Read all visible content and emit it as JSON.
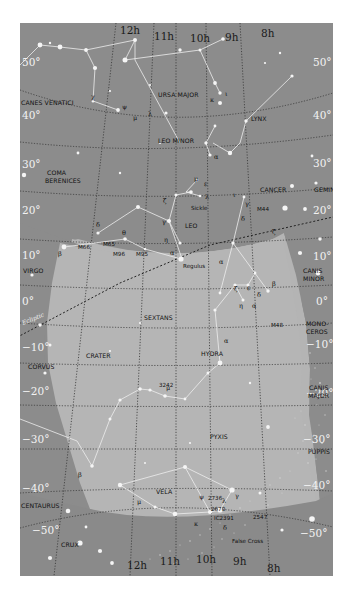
{
  "map": {
    "colors": {
      "outside_region": "#8c8c8c",
      "highlight_region": "#b4b4b4",
      "grid": "#3a3a3a",
      "constellation_lines": "#eeeeee",
      "stars": "#f4f4f4",
      "labels": "#111111"
    },
    "ra_labels_top": [
      "12h",
      "11h",
      "10h",
      "9h",
      "8h"
    ],
    "ra_labels_bottom": [
      "12h",
      "11h",
      "10h",
      "9h",
      "8h"
    ],
    "dec_labels_left": [
      "50°",
      "40°",
      "30°",
      "20°",
      "10°",
      "0°",
      "−10°",
      "−20°",
      "−30°",
      "−40°",
      "−50°"
    ],
    "dec_labels_right": [
      "50°",
      "40°",
      "30°",
      "20°",
      "10°",
      "0°",
      "−10°",
      "−20°",
      "−30°",
      "−40°",
      "−50°"
    ],
    "ecliptic_label": "Ecliptic",
    "constellations": [
      {
        "name": "URSA MAJOR"
      },
      {
        "name": "CANES VENATICI"
      },
      {
        "name": "LYNX"
      },
      {
        "name": "LEO MINOR"
      },
      {
        "name": "COMA BERENICES",
        "line1": "COMA",
        "line2": "BERENICES"
      },
      {
        "name": "CANCER"
      },
      {
        "name": "GEMINI"
      },
      {
        "name": "LEO"
      },
      {
        "name": "VIRGO"
      },
      {
        "name": "CANIS MINOR",
        "line1": "CANIS",
        "line2": "MINOR"
      },
      {
        "name": "SEXTANS"
      },
      {
        "name": "MONOCEROS",
        "line1": "MONO-",
        "line2": "CEROS"
      },
      {
        "name": "CRATER"
      },
      {
        "name": "CORVUS"
      },
      {
        "name": "HYDRA"
      },
      {
        "name": "CANIS MAJOR",
        "line1": "CANIS",
        "line2": "MAJOR"
      },
      {
        "name": "PYXIS"
      },
      {
        "name": "PUPPIS"
      },
      {
        "name": "VELA"
      },
      {
        "name": "CENTAURUS"
      },
      {
        "name": "CRUX"
      }
    ],
    "objects": {
      "sickle": "Sickle",
      "regulus": "Regulus",
      "m44": "M44",
      "m66": "M66",
      "m65": "M65",
      "m96": "M96",
      "m95": "M95",
      "m48": "M48",
      "ngc3242": "3242",
      "ngc2736": "2736",
      "ngc2670": "2670",
      "ic2391": "IC2391",
      "ngc2547": "2547",
      "false_cross": "False Cross"
    },
    "greek": {
      "alpha": "α",
      "beta": "β",
      "gamma": "γ",
      "delta": "δ",
      "epsilon": "ε",
      "zeta": "ζ",
      "eta": "η",
      "theta": "θ",
      "iota": "ι",
      "kappa": "κ",
      "lambda": "λ",
      "mu": "μ",
      "pi": "π",
      "chi": "χ",
      "psi": "ψ",
      "xi": "ξ"
    }
  }
}
